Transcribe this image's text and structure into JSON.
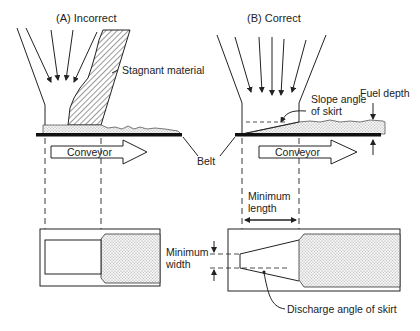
{
  "panels": {
    "a": {
      "title": "(A) Incorrect",
      "labels": {
        "stagnant": "Stagnant material",
        "conveyor": "Conveyor",
        "min_width_1": "Minimum",
        "min_width_2": "width"
      }
    },
    "b": {
      "title": "(B) Correct",
      "labels": {
        "slope_1": "Slope angle",
        "slope_2": "of skirt",
        "fuel_depth": "Fuel depth",
        "conveyor": "Conveyor",
        "min_length_1": "Minimum",
        "min_length_2": "length",
        "discharge": "Discharge angle of skirt"
      }
    },
    "shared": {
      "belt": "Belt"
    }
  },
  "colors": {
    "line": "#222222",
    "fill_dots": "#bdbdbd",
    "hatch": "#333333"
  }
}
